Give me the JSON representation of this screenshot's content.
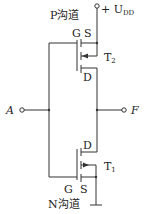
{
  "diagram": {
    "supply_label": "+ U",
    "supply_sub": "DD",
    "input_label": "A",
    "output_label": "F",
    "top_transistor": {
      "name": "T",
      "sub": "2",
      "channel_label": "P沟道",
      "gate_label": "G",
      "source_label": "S",
      "drain_label": "D"
    },
    "bottom_transistor": {
      "name": "T",
      "sub": "1",
      "channel_label": "N沟道",
      "gate_label": "G",
      "source_label": "S",
      "drain_label": "D"
    },
    "colors": {
      "line": "#333333",
      "text": "#222222",
      "background": "#ffffff"
    }
  }
}
